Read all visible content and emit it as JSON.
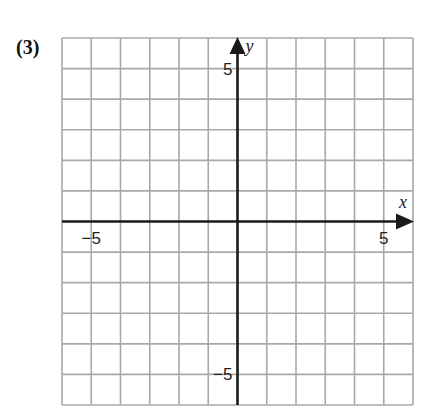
{
  "problem_label": "(3)",
  "chart_data": {
    "type": "scatter",
    "title": "",
    "xlabel": "x",
    "ylabel": "y",
    "xlim": [
      -6,
      6
    ],
    "ylim": [
      -6,
      6
    ],
    "grid": true,
    "grid_step": 1,
    "x_tick_labels": [
      {
        "value": -5,
        "label": "−5"
      },
      {
        "value": 5,
        "label": "5"
      }
    ],
    "y_tick_labels": [
      {
        "value": 5,
        "label": "5"
      },
      {
        "value": -5,
        "label": "−5"
      }
    ],
    "series": [],
    "axes_arrows": [
      "positive-x",
      "positive-y"
    ]
  },
  "colors": {
    "grid": "#a8a8a8",
    "axis": "#1a1a1a",
    "text": "#222222"
  }
}
